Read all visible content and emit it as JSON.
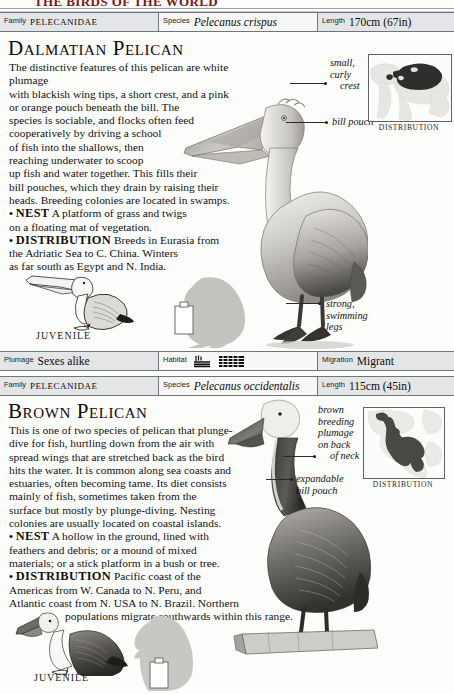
{
  "page": {
    "partial_top_text": "THE BIRDS OF THE WORLD",
    "width": 454,
    "height": 694
  },
  "entries": [
    {
      "id": "dalmatian-pelican",
      "header": {
        "family_label": "Family",
        "family_value": "PELECANIDAE",
        "species_label": "Species",
        "species_value": "Pelecanus crispus",
        "length_label": "Length",
        "length_value": "170cm (67in)"
      },
      "title": "Dalmatian Pelican",
      "paragraphs": [
        "The distinctive features of this pelican are white plumage with blackish wing tips, a short crest, and a pink or orange pouch beneath the bill. The species is sociable, and flocks often feed cooperatively by driving a school of fish into the shallows, then reaching underwater to scoop up fish and water together. This fills their bill pouches, which they drain by raising their heads. Breeding colonies are located in swamps."
      ],
      "facts": [
        {
          "keyword": "NEST",
          "text": "A platform of grass and twigs on a floating mat of vegetation."
        },
        {
          "keyword": "DISTRIBUTION",
          "text": "Breeds in Eurasia from the Adriatic Sea to C. China. Winters as far south as Egypt and N. India."
        }
      ],
      "annotations": [
        {
          "name": "crest",
          "lines": [
            "small,",
            "curly",
            "crest"
          ]
        },
        {
          "name": "bill-pouch",
          "lines": [
            "bill pouch"
          ]
        },
        {
          "name": "legs",
          "lines": [
            "strong,",
            "swimming",
            "legs"
          ]
        }
      ],
      "map_caption": "DISTRIBUTION",
      "juvenile_caption": "JUVENILE",
      "footer": {
        "plumage_label": "Plumage",
        "plumage_value": "Sexes alike",
        "habitat_label": "Habitat",
        "habitat_icons": [
          "reeds-water-icon",
          "open-water-icon"
        ],
        "migration_label": "Migration",
        "migration_value": "Migrant"
      }
    },
    {
      "id": "brown-pelican",
      "header": {
        "family_label": "Family",
        "family_value": "PELECANIDAE",
        "species_label": "Species",
        "species_value": "Pelecanus occidentalis",
        "length_label": "Length",
        "length_value": "115cm (45in)"
      },
      "title": "Brown Pelican",
      "paragraphs": [
        "This is one of two species of pelican that plunge-dive for fish, hurtling down from the air with spread wings that are stretched back as the bird hits the water. It is common along sea coasts and estuaries, often becoming tame. Its diet consists mainly of fish, sometimes taken from the surface but mostly by plunge-diving. Nesting colonies are usually located on coastal islands."
      ],
      "facts": [
        {
          "keyword": "NEST",
          "text": "A hollow in the ground, lined with feathers and debris; or a mound of mixed materials; or a stick platform in a bush or tree."
        },
        {
          "keyword": "DISTRIBUTION",
          "text": "Pacific coast of the Americas from W. Canada to N. Peru, and Atlantic coast from N. USA to N. Brazil. Northern populations migrate southwards within this range."
        }
      ],
      "annotations": [
        {
          "name": "breeding-plumage",
          "lines": [
            "brown",
            "breeding",
            "plumage",
            "on back",
            "of neck"
          ]
        },
        {
          "name": "bill-pouch",
          "lines": [
            "expandable",
            "bill pouch"
          ]
        }
      ],
      "map_caption": "DISTRIBUTION",
      "juvenile_caption": "JUVENILE"
    }
  ],
  "colors": {
    "bar_shade": "#e4e5e6",
    "bar_light": "#f7f7f6",
    "rule": "#6f757b",
    "text": "#111111",
    "map_range": "#3a3a3a",
    "silhouette": "#bdbdbd"
  }
}
